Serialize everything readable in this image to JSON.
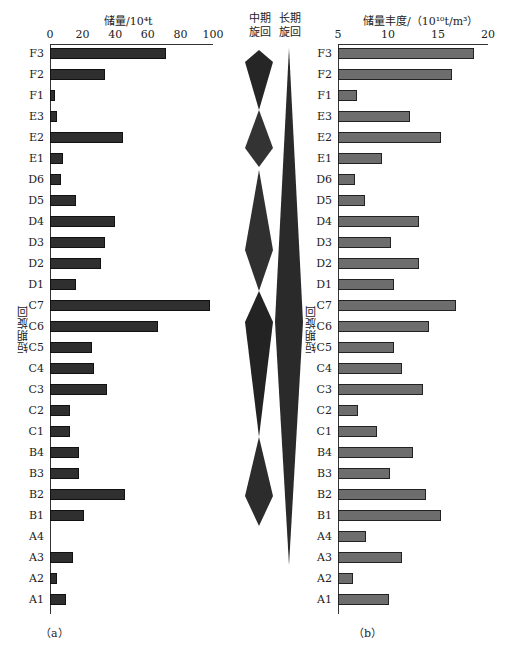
{
  "chart_data": [
    {
      "type": "bar",
      "orientation": "horizontal",
      "panel": "(a)",
      "title": "储量/10⁴t",
      "xlabel": "储量/10⁴t",
      "ylabel": "短期旋回",
      "xlim": [
        0,
        100
      ],
      "xticks": [
        "0",
        "20",
        "40",
        "60",
        "80",
        "100"
      ],
      "categories": [
        "F3",
        "F2",
        "F1",
        "E3",
        "E2",
        "E1",
        "D6",
        "D5",
        "D4",
        "D3",
        "D2",
        "D1",
        "C7",
        "C6",
        "C5",
        "C4",
        "C3",
        "C2",
        "C1",
        "B4",
        "B3",
        "B2",
        "B1",
        "A4",
        "A3",
        "A2",
        "A1"
      ],
      "values": [
        71,
        34,
        3,
        4,
        45,
        8,
        7,
        16,
        40,
        34,
        31,
        16,
        98,
        66,
        26,
        27,
        35,
        12,
        12,
        18,
        18,
        46,
        21,
        0,
        14,
        4,
        10
      ],
      "bar_color": "#2f2f2f",
      "grid": false
    },
    {
      "type": "bar",
      "orientation": "horizontal",
      "panel": "(b)",
      "title": "储量丰度/（10¹⁰t/m³）",
      "xlabel": "储量丰度/（10¹⁰t/m³）",
      "ylabel": "短期旋回",
      "xlim": [
        5,
        20
      ],
      "xticks": [
        "5",
        "10",
        "15",
        "20"
      ],
      "categories": [
        "F3",
        "F2",
        "F1",
        "E3",
        "E2",
        "E1",
        "D6",
        "D5",
        "D4",
        "D3",
        "D2",
        "D1",
        "C7",
        "C6",
        "C5",
        "C4",
        "C3",
        "C2",
        "C1",
        "B4",
        "B3",
        "B2",
        "B1",
        "A4",
        "A3",
        "A2",
        "A1"
      ],
      "values": [
        18.6,
        16.4,
        6.9,
        12.2,
        15.3,
        9.4,
        6.7,
        7.7,
        13.1,
        10.3,
        13.1,
        10.6,
        16.8,
        14.1,
        10.6,
        11.4,
        13.5,
        7.0,
        8.9,
        12.5,
        10.2,
        13.8,
        15.3,
        7.8,
        11.4,
        6.5,
        10.1
      ],
      "bar_color": "#6d6d6d",
      "grid": false
    }
  ],
  "panel_a": {
    "axis_title": "储量/10⁴t",
    "ticks": [
      "0",
      "20",
      "40",
      "60",
      "80",
      "100"
    ],
    "y_label": "短期旋回",
    "sub_label": "（a）"
  },
  "panel_b": {
    "axis_title": "储量丰度/（10¹⁰t/m³）",
    "ticks": [
      "5",
      "10",
      "15",
      "20"
    ],
    "y_label": "短期旋回",
    "sub_label": "（b）"
  },
  "cycles": {
    "medium_title_1": "中期",
    "medium_title_2": "旋回",
    "long_title_1": "长期",
    "long_title_2": "旋回"
  },
  "categories": [
    "F3",
    "F2",
    "F1",
    "E3",
    "E2",
    "E1",
    "D6",
    "D5",
    "D4",
    "D3",
    "D2",
    "D1",
    "C7",
    "C6",
    "C5",
    "C4",
    "C3",
    "C2",
    "C1",
    "B4",
    "B3",
    "B2",
    "B1",
    "A4",
    "A3",
    "A2",
    "A1"
  ]
}
